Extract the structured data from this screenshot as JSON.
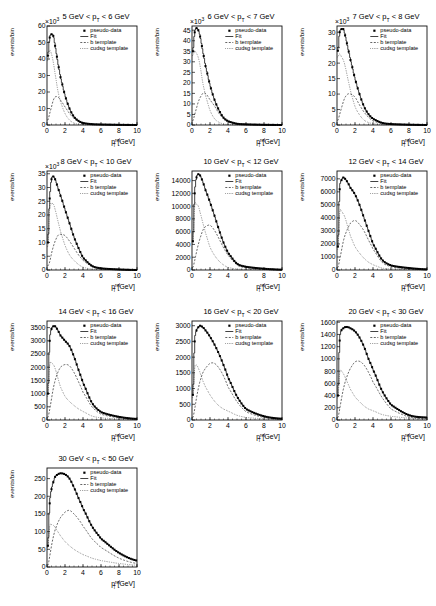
{
  "figure": {
    "legend": {
      "data": "pseudo-data",
      "fit": "Fit",
      "b": "b template",
      "cudsg": "cudsg template"
    },
    "xlabel": "p_T^rel [GeV]",
    "ylabel": "events/bin"
  },
  "chart_data": [
    {
      "type": "line",
      "title": "5 GeV < p_T < 6 GeV",
      "xlabel": "p_T^rel [GeV]",
      "ylabel": "events/bin",
      "y_multiplier": "x10^3",
      "xlim": [
        0,
        10
      ],
      "ylim": [
        0,
        60
      ],
      "yticks": [
        0,
        10,
        20,
        30,
        40,
        50,
        60
      ],
      "xticks": [
        0,
        2,
        4,
        6,
        8,
        10
      ],
      "x": [
        0.1,
        0.3,
        0.5,
        0.7,
        0.9,
        1.2,
        1.5,
        2.0,
        2.5,
        3.0,
        3.5,
        4.0,
        5.0,
        6.0,
        8.0,
        10.0
      ],
      "series": [
        {
          "name": "pseudo-data",
          "values": [
            42,
            53,
            55,
            54,
            48,
            38,
            29,
            18,
            10,
            5,
            2.5,
            1.2,
            0.5,
            0.3,
            0.1,
            0
          ]
        },
        {
          "name": "b template",
          "values": [
            3,
            7,
            11,
            15,
            17,
            17,
            15,
            11,
            7,
            4,
            2,
            1,
            0.4,
            0.2,
            0.1,
            0
          ]
        },
        {
          "name": "cudsg template",
          "values": [
            39,
            45,
            43,
            38,
            31,
            21,
            14,
            7,
            3,
            1.2,
            0.5,
            0.2,
            0.1,
            0.1,
            0,
            0
          ]
        }
      ]
    },
    {
      "type": "line",
      "title": "6 GeV < p_T < 7 GeV",
      "xlabel": "p_T^rel [GeV]",
      "ylabel": "events/bin",
      "y_multiplier": "x10^3",
      "xlim": [
        0,
        10
      ],
      "ylim": [
        0,
        47
      ],
      "yticks": [
        0,
        5,
        10,
        15,
        20,
        25,
        30,
        35,
        40,
        45
      ],
      "xticks": [
        0,
        2,
        4,
        6,
        8,
        10
      ],
      "x": [
        0.1,
        0.3,
        0.5,
        0.7,
        0.9,
        1.2,
        1.5,
        2.0,
        2.5,
        3.0,
        3.5,
        4.0,
        5.0,
        6.0,
        8.0,
        10.0
      ],
      "series": [
        {
          "name": "pseudo-data",
          "values": [
            35,
            44,
            46,
            45,
            42,
            35,
            28,
            19,
            12,
            7,
            3.5,
            1.8,
            0.6,
            0.3,
            0.1,
            0
          ]
        },
        {
          "name": "b template",
          "values": [
            2,
            5,
            8,
            11,
            13,
            15,
            15,
            12,
            9,
            5.5,
            3,
            1.5,
            0.5,
            0.2,
            0.1,
            0
          ]
        },
        {
          "name": "cudsg template",
          "values": [
            33,
            35,
            34,
            32,
            28,
            20,
            14,
            7,
            3,
            1.3,
            0.5,
            0.2,
            0.1,
            0.1,
            0,
            0
          ]
        }
      ]
    },
    {
      "type": "line",
      "title": "7 GeV < p_T < 8 GeV",
      "xlabel": "p_T^rel [GeV]",
      "ylabel": "events/bin",
      "y_multiplier": "x10^3",
      "xlim": [
        0,
        10
      ],
      "ylim": [
        0,
        32
      ],
      "yticks": [
        0,
        5,
        10,
        15,
        20,
        25,
        30
      ],
      "xticks": [
        0,
        2,
        4,
        6,
        8,
        10
      ],
      "x": [
        0.1,
        0.3,
        0.5,
        0.7,
        0.9,
        1.2,
        1.5,
        2.0,
        2.5,
        3.0,
        3.5,
        4.0,
        5.0,
        6.0,
        8.0,
        10.0
      ],
      "series": [
        {
          "name": "pseudo-data",
          "values": [
            24,
            30,
            31,
            31,
            29,
            25,
            21,
            15,
            10,
            6,
            3.5,
            2,
            0.7,
            0.3,
            0.1,
            0
          ]
        },
        {
          "name": "b template",
          "values": [
            1.5,
            3.5,
            5.5,
            7.5,
            9,
            10,
            10,
            9,
            6.5,
            4.2,
            2.5,
            1.3,
            0.5,
            0.2,
            0.1,
            0
          ]
        },
        {
          "name": "cudsg template",
          "values": [
            22,
            23,
            22,
            21,
            19,
            15,
            11,
            6,
            3.3,
            1.6,
            0.8,
            0.4,
            0.1,
            0.1,
            0,
            0
          ]
        }
      ]
    },
    {
      "type": "line",
      "title": "8 GeV < p_T < 10 GeV",
      "xlabel": "p_T^rel [GeV]",
      "ylabel": "events/bin",
      "y_multiplier": "x10^3",
      "xlim": [
        0,
        10
      ],
      "ylim": [
        0,
        36
      ],
      "yticks": [
        0,
        5,
        10,
        15,
        20,
        25,
        30,
        35
      ],
      "xticks": [
        0,
        2,
        4,
        6,
        8,
        10
      ],
      "x": [
        0.1,
        0.3,
        0.5,
        0.7,
        0.9,
        1.2,
        1.5,
        2.0,
        2.5,
        3.0,
        3.5,
        4.0,
        5.0,
        6.0,
        8.0,
        10.0
      ],
      "series": [
        {
          "name": "pseudo-data",
          "values": [
            10,
            26,
            33,
            34,
            33,
            30,
            27,
            22,
            17,
            12,
            8,
            4.5,
            1.5,
            0.6,
            0.2,
            0
          ]
        },
        {
          "name": "b template",
          "values": [
            1.5,
            3,
            6,
            8.5,
            10.5,
            12.5,
            13,
            12.5,
            10.5,
            8,
            5.5,
            3.5,
            1.2,
            0.4,
            0.1,
            0
          ]
        },
        {
          "name": "cudsg template",
          "values": [
            8.5,
            23,
            24,
            24,
            22,
            18,
            14,
            9,
            5.5,
            3.5,
            2,
            1,
            0.3,
            0.2,
            0.1,
            0
          ]
        }
      ]
    },
    {
      "type": "line",
      "title": "10 GeV < p_T < 12 GeV",
      "xlabel": "p_T^rel [GeV]",
      "ylabel": "events/bin",
      "xlim": [
        0,
        10
      ],
      "ylim": [
        0,
        15500
      ],
      "yticks": [
        0,
        2000,
        4000,
        6000,
        8000,
        10000,
        12000,
        14000
      ],
      "xticks": [
        0,
        2,
        4,
        6,
        8,
        10
      ],
      "x": [
        0.1,
        0.3,
        0.5,
        0.7,
        0.9,
        1.2,
        1.5,
        2.0,
        2.5,
        3.0,
        3.5,
        4.0,
        5.0,
        6.0,
        8.0,
        10.0
      ],
      "series": [
        {
          "name": "pseudo-data",
          "values": [
            4500,
            12000,
            14500,
            15000,
            14800,
            13800,
            12500,
            10600,
            8500,
            6300,
            4300,
            2700,
            1000,
            500,
            200,
            50
          ]
        },
        {
          "name": "b template",
          "values": [
            400,
            1500,
            2800,
            4000,
            5000,
            6200,
            6800,
            7000,
            6200,
            4900,
            3500,
            2300,
            800,
            350,
            100,
            30
          ]
        },
        {
          "name": "cudsg template",
          "values": [
            4100,
            10000,
            10300,
            10000,
            9000,
            7400,
            5800,
            3600,
            2300,
            1400,
            800,
            400,
            150,
            100,
            50,
            20
          ]
        }
      ]
    },
    {
      "type": "line",
      "title": "12 GeV < p_T < 14 GeV",
      "xlabel": "p_T^rel [GeV]",
      "ylabel": "events/bin",
      "xlim": [
        0,
        10
      ],
      "ylim": [
        0,
        7600
      ],
      "yticks": [
        0,
        1000,
        2000,
        3000,
        4000,
        5000,
        6000,
        7000
      ],
      "xticks": [
        0,
        2,
        4,
        6,
        8,
        10
      ],
      "x": [
        0.1,
        0.3,
        0.5,
        0.7,
        0.9,
        1.2,
        1.5,
        2.0,
        2.5,
        3.0,
        3.5,
        4.0,
        5.0,
        6.0,
        8.0,
        10.0
      ],
      "series": [
        {
          "name": "pseudo-data",
          "values": [
            1800,
            6200,
            6900,
            7100,
            7000,
            6700,
            6300,
            5800,
            5000,
            4000,
            3000,
            2000,
            800,
            350,
            150,
            50
          ]
        },
        {
          "name": "b template",
          "values": [
            200,
            800,
            1500,
            2200,
            2700,
            3200,
            3600,
            3800,
            3500,
            3000,
            2300,
            1600,
            600,
            250,
            80,
            30
          ]
        },
        {
          "name": "cudsg template",
          "values": [
            1600,
            4400,
            4500,
            4300,
            4000,
            3300,
            2600,
            1800,
            1300,
            900,
            600,
            400,
            150,
            80,
            40,
            15
          ]
        }
      ]
    },
    {
      "type": "line",
      "title": "14 GeV < p_T < 16 GeV",
      "xlabel": "p_T^rel [GeV]",
      "ylabel": "events/bin",
      "xlim": [
        0,
        10
      ],
      "ylim": [
        0,
        3750
      ],
      "yticks": [
        0,
        500,
        1000,
        1500,
        2000,
        2500,
        3000,
        3500
      ],
      "xticks": [
        0,
        2,
        4,
        6,
        8,
        10
      ],
      "x": [
        0.1,
        0.3,
        0.5,
        0.7,
        0.9,
        1.2,
        1.5,
        2.0,
        2.5,
        3.0,
        3.5,
        4.0,
        5.0,
        6.0,
        8.0,
        10.0
      ],
      "series": [
        {
          "name": "pseudo-data",
          "values": [
            1000,
            3000,
            3450,
            3550,
            3550,
            3400,
            3200,
            3000,
            2800,
            2400,
            1900,
            1400,
            650,
            300,
            120,
            40
          ]
        },
        {
          "name": "b template",
          "values": [
            100,
            400,
            800,
            1200,
            1500,
            1800,
            2000,
            2100,
            2050,
            1800,
            1450,
            1050,
            500,
            220,
            80,
            25
          ]
        },
        {
          "name": "cudsg template",
          "values": [
            900,
            2100,
            2150,
            2100,
            1950,
            1600,
            1250,
            900,
            700,
            550,
            420,
            320,
            150,
            80,
            40,
            15
          ]
        }
      ]
    },
    {
      "type": "line",
      "title": "16 GeV < p_T < 20 GeV",
      "xlabel": "p_T^rel [GeV]",
      "ylabel": "events/bin",
      "xlim": [
        0,
        10
      ],
      "ylim": [
        0,
        3150
      ],
      "yticks": [
        0,
        500,
        1000,
        1500,
        2000,
        2500,
        3000
      ],
      "xticks": [
        0,
        2,
        4,
        6,
        8,
        10
      ],
      "x": [
        0.1,
        0.3,
        0.5,
        0.7,
        0.9,
        1.2,
        1.5,
        2.0,
        2.5,
        3.0,
        3.5,
        4.0,
        5.0,
        6.0,
        8.0,
        10.0
      ],
      "series": [
        {
          "name": "pseudo-data",
          "values": [
            800,
            2500,
            2850,
            2950,
            3000,
            2950,
            2850,
            2650,
            2400,
            2100,
            1750,
            1350,
            750,
            350,
            120,
            40
          ]
        },
        {
          "name": "b template",
          "values": [
            80,
            350,
            700,
            1000,
            1250,
            1500,
            1650,
            1800,
            1800,
            1650,
            1400,
            1050,
            580,
            260,
            80,
            25
          ]
        },
        {
          "name": "cudsg template",
          "values": [
            720,
            1650,
            1750,
            1650,
            1500,
            1250,
            1050,
            800,
            600,
            450,
            350,
            280,
            150,
            80,
            40,
            15
          ]
        }
      ]
    },
    {
      "type": "line",
      "title": "20 GeV < p_T < 30 GeV",
      "xlabel": "p_T^rel [GeV]",
      "ylabel": "events/bin",
      "xlim": [
        0,
        10
      ],
      "ylim": [
        0,
        1620
      ],
      "yticks": [
        0,
        200,
        400,
        600,
        800,
        1000,
        1200,
        1400,
        1600
      ],
      "xticks": [
        0,
        2,
        4,
        6,
        8,
        10
      ],
      "x": [
        0.1,
        0.3,
        0.5,
        0.7,
        0.9,
        1.2,
        1.5,
        2.0,
        2.5,
        3.0,
        3.5,
        4.0,
        5.0,
        6.0,
        8.0,
        10.0
      ],
      "series": [
        {
          "name": "pseudo-data",
          "values": [
            400,
            1300,
            1470,
            1500,
            1520,
            1520,
            1500,
            1450,
            1350,
            1200,
            1000,
            820,
            480,
            250,
            80,
            40
          ]
        },
        {
          "name": "b template",
          "values": [
            40,
            180,
            350,
            500,
            620,
            750,
            850,
            950,
            960,
            900,
            780,
            620,
            370,
            180,
            50,
            20
          ]
        },
        {
          "name": "cudsg template",
          "values": [
            360,
            780,
            800,
            760,
            700,
            600,
            500,
            380,
            300,
            230,
            180,
            150,
            90,
            60,
            30,
            15
          ]
        }
      ]
    },
    {
      "type": "line",
      "title": "30 GeV < p_T < 50 GeV",
      "xlabel": "p_T^rel [GeV]",
      "ylabel": "events/bin",
      "xlim": [
        0,
        10
      ],
      "ylim": [
        0,
        280
      ],
      "yticks": [
        0,
        50,
        100,
        150,
        200,
        250
      ],
      "xticks": [
        0,
        2,
        4,
        6,
        8,
        10
      ],
      "x": [
        0.1,
        0.3,
        0.5,
        0.7,
        0.9,
        1.2,
        1.5,
        2.0,
        2.5,
        3.0,
        3.5,
        4.0,
        5.0,
        6.0,
        8.0,
        10.0
      ],
      "series": [
        {
          "name": "pseudo-data",
          "values": [
            60,
            180,
            220,
            240,
            255,
            262,
            265,
            262,
            250,
            225,
            195,
            165,
            115,
            80,
            40,
            18
          ]
        },
        {
          "name": "b template",
          "values": [
            5,
            30,
            60,
            85,
            105,
            125,
            140,
            155,
            160,
            150,
            135,
            115,
            80,
            55,
            25,
            10
          ]
        },
        {
          "name": "cudsg template",
          "values": [
            55,
            115,
            120,
            118,
            112,
            100,
            88,
            72,
            60,
            50,
            42,
            35,
            25,
            18,
            10,
            5
          ]
        }
      ]
    }
  ]
}
